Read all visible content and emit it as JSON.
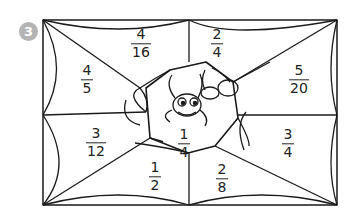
{
  "exercise": {
    "number": "3",
    "badge_color": "#b4b4b4"
  },
  "fractions": [
    {
      "id": "top-left",
      "numerator": "4",
      "denominator": "16",
      "x": 141,
      "y": 44
    },
    {
      "id": "top-right",
      "numerator": "2",
      "denominator": "4",
      "x": 217,
      "y": 44
    },
    {
      "id": "left",
      "numerator": "4",
      "denominator": "5",
      "x": 87,
      "y": 80
    },
    {
      "id": "right",
      "numerator": "5",
      "denominator": "20",
      "x": 299,
      "y": 80
    },
    {
      "id": "center",
      "numerator": "1",
      "denominator": "4",
      "x": 184,
      "y": 144
    },
    {
      "id": "lower-left",
      "numerator": "3",
      "denominator": "12",
      "x": 96,
      "y": 143
    },
    {
      "id": "lower-right",
      "numerator": "3",
      "denominator": "4",
      "x": 288,
      "y": 144
    },
    {
      "id": "bottom-left",
      "numerator": "1",
      "denominator": "2",
      "x": 155,
      "y": 177
    },
    {
      "id": "bottom-right",
      "numerator": "2",
      "denominator": "8",
      "x": 222,
      "y": 179
    }
  ]
}
